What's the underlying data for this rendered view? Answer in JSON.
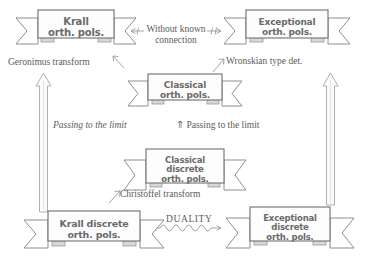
{
  "diagram": {
    "nodes": [
      {
        "id": "krall-orth",
        "lines": [
          "Krall",
          "orth. pols."
        ]
      },
      {
        "id": "exceptional-orth",
        "lines": [
          "Exceptional",
          "orth. pols."
        ]
      },
      {
        "id": "classical-orth",
        "lines": [
          "Classical",
          "orth. pols."
        ]
      },
      {
        "id": "classical-discrete",
        "lines": [
          "Classical",
          "discrete",
          "orth. pols."
        ]
      },
      {
        "id": "krall-discrete",
        "lines": [
          "Krall discrete",
          "orth. pols."
        ]
      },
      {
        "id": "exceptional-discrete",
        "lines": [
          "Exceptional",
          "discrete",
          "orth. pols."
        ]
      }
    ],
    "labels": {
      "without_known_connection_line1": "Without known",
      "without_known_connection_line2": "connection",
      "geronimus": "Geronimus transform",
      "wronskian": "Wronskian type det.",
      "passing_left": "Passing to the limit",
      "passing_right": "Passing to the limit",
      "passing_right_arrow": "⇑",
      "christoffel": "Christoffel transform",
      "duality": "DUALITY"
    },
    "colors": {
      "ribbon_text": "#6a6a6a",
      "ribbon_outline": "#6f6f6f",
      "ribbon_tail": "#8e8e8e",
      "annotation_text": "#5b5b5b",
      "arrow_stroke": "#b0b0b0",
      "background": "#ffffff"
    }
  }
}
